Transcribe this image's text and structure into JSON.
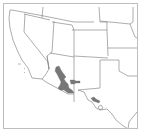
{
  "map": {
    "title": "Species range map",
    "region": "Southwestern United States",
    "colors": {
      "background": "#ffffff",
      "frame": "#bdbdbd",
      "state_borders": "#8a8a8a",
      "range_fill": "#777777"
    },
    "states_visible": [
      "California",
      "Nevada",
      "Oregon",
      "Idaho",
      "Utah",
      "Arizona",
      "Wyoming",
      "Colorado",
      "New Mexico",
      "Nebraska",
      "Kansas",
      "Oklahoma",
      "Texas",
      "South Dakota",
      "Iowa",
      "Missouri"
    ],
    "range_areas": [
      {
        "name": "Southeastern Arizona range",
        "state": "Arizona"
      },
      {
        "name": "Southwestern New Mexico extension",
        "state": "New Mexico"
      },
      {
        "name": "Trans-Pecos Texas range",
        "state": "Texas"
      }
    ]
  }
}
